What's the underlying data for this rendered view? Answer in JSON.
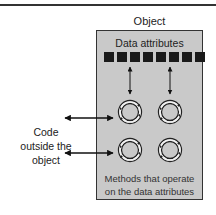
{
  "diagram": {
    "object_label": "Object",
    "data_attributes_label": "Data attributes",
    "data_attribute_count": 8,
    "code_outside_lines": [
      "Code",
      "outside the",
      "object"
    ],
    "methods_lines": [
      "Methods that operate",
      "on the data attributes"
    ],
    "method_count": 4,
    "colors": {
      "box_fill": "#c9c9c9",
      "box_border": "#333333",
      "attribute_square": "#1a1a1a",
      "arrow": "#111111"
    },
    "connections": [
      {
        "from": "data-attributes",
        "to": "method-1",
        "type": "bidirectional"
      },
      {
        "from": "data-attributes",
        "to": "method-2",
        "type": "bidirectional"
      },
      {
        "from": "code-outside",
        "to": "method-1",
        "type": "bidirectional"
      },
      {
        "from": "code-outside",
        "to": "method-3",
        "type": "bidirectional"
      }
    ]
  }
}
